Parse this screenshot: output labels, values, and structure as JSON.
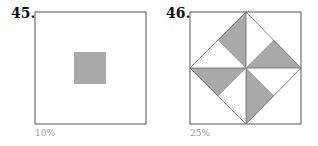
{
  "problems": [
    {
      "number": "45.",
      "answer": "10%"
    },
    {
      "number": "46.",
      "answer": "25%"
    }
  ],
  "colors": {
    "shade": "#a9a9a9",
    "border": "#555555",
    "answer_text": "#999999"
  }
}
